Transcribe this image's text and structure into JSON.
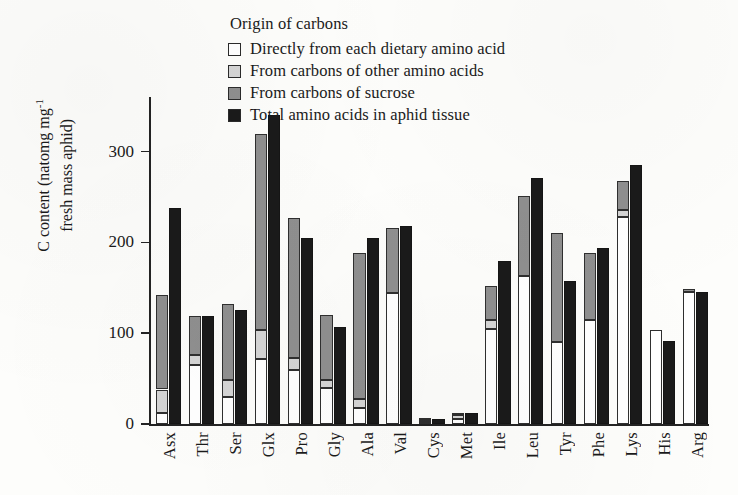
{
  "chart_data": {
    "type": "bar",
    "title": "",
    "subtitle": "",
    "xlabel": "",
    "ylabel": "C content (natomg mg-1 fresh mass aphid)",
    "ylabel_line1": "C content (natomg mg",
    "ylabel_sup": "-1",
    "ylabel_line2": "fresh mass aphid)",
    "ylim": [
      0,
      360
    ],
    "yticks": [
      0,
      100,
      200,
      300
    ],
    "ytick_labels": [
      "0",
      "100",
      "200",
      "300"
    ],
    "grid": false,
    "stacked": true,
    "legend_title": "Origin of carbons",
    "legend_position": "top-center",
    "categories": [
      "Asx",
      "Thr",
      "Ser",
      "Glx",
      "Pro",
      "Gly",
      "Ala",
      "Val",
      "Cys",
      "Met",
      "Ile",
      "Leu",
      "Tyr",
      "Phe",
      "Lys",
      "His",
      "Arg"
    ],
    "series": [
      {
        "name": "Directly from each dietary amino acid",
        "color": "#ffffff",
        "stack": "composition",
        "values": [
          12,
          65,
          30,
          72,
          60,
          40,
          18,
          144,
          2,
          6,
          105,
          163,
          90,
          115,
          228,
          104,
          145
        ]
      },
      {
        "name": "From carbons of other amino acids",
        "color": "#d5d5d5",
        "stack": "composition",
        "values": [
          26,
          11,
          18,
          31,
          13,
          9,
          9,
          0,
          2,
          4,
          10,
          0,
          0,
          0,
          8,
          0,
          0
        ]
      },
      {
        "name": "From carbons of sucrose",
        "color": "#8f8f8f",
        "stack": "composition",
        "values": [
          104,
          43,
          84,
          216,
          154,
          71,
          161,
          72,
          1,
          2,
          37,
          88,
          120,
          73,
          31,
          0,
          4
        ]
      },
      {
        "name": "Total amino acids in aphid tissue",
        "color": "#1a1a1a",
        "stack": "total",
        "values": [
          238,
          119,
          126,
          340,
          205,
          107,
          205,
          218,
          5,
          12,
          179,
          271,
          157,
          194,
          285,
          91,
          145
        ]
      }
    ],
    "stack_totals": [
      142,
      119,
      132,
      319,
      227,
      120,
      188,
      216,
      5,
      12,
      152,
      251,
      210,
      188,
      267,
      104,
      149
    ]
  },
  "legend": {
    "title": "Origin of carbons",
    "items": [
      {
        "label": "Directly from each dietary amino acid",
        "swatch": "#ffffff"
      },
      {
        "label": "From carbons of other amino acids",
        "swatch": "#d5d5d5"
      },
      {
        "label": "From carbons of sucrose",
        "swatch": "#8f8f8f"
      },
      {
        "label": "Total amino acids in aphid tissue",
        "swatch": "#1a1a1a"
      }
    ]
  }
}
